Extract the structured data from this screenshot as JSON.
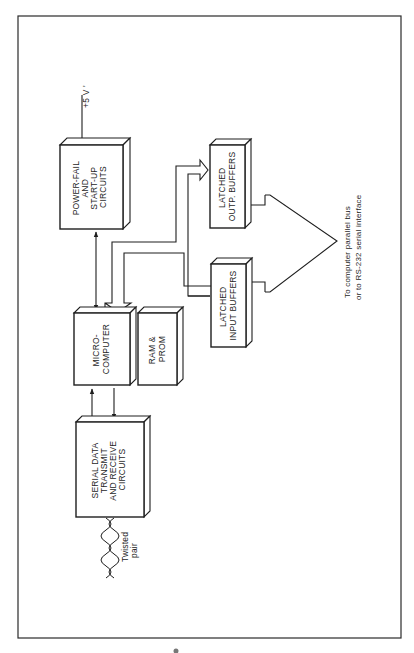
{
  "diagram": {
    "type": "block-diagram",
    "orientation": "rotated-90-ccw",
    "blocks": {
      "power_fail": {
        "lines": [
          "POWER-FAIL",
          "AND",
          "START-UP",
          "CIRCUITS"
        ]
      },
      "latched_output": {
        "lines": [
          "LATCHED",
          "OUTP. BUFFERS"
        ]
      },
      "latched_input": {
        "lines": [
          "LATCHED",
          "INPUT BUFFERS"
        ]
      },
      "microcomputer": {
        "lines": [
          "MICRO-",
          "COMPUTER"
        ]
      },
      "ram_prom": {
        "lines": [
          "RAM &",
          "PROM"
        ]
      },
      "serial": {
        "lines": [
          "SERIAL DATA",
          "TRANSMIT",
          "AND RECEIVE",
          "CIRCUITS"
        ]
      }
    },
    "labels": {
      "power_input": "+5 V '",
      "twisted_pair": [
        "Twisted",
        "pair"
      ],
      "destination": [
        "To computer parallel bus",
        "or to RS-232 serial interface"
      ]
    },
    "connections": [
      {
        "from": "+5 V",
        "to": "power_fail",
        "kind": "arrow"
      },
      {
        "from": "power_fail",
        "to": "microcomputer",
        "kind": "bidirectional"
      },
      {
        "from": "microcomputer",
        "to": "latched_output",
        "kind": "bus"
      },
      {
        "from": "latched_input",
        "to": "microcomputer",
        "kind": "bus"
      },
      {
        "from": "microcomputer",
        "to": "serial",
        "kind": "arrow"
      },
      {
        "from": "serial",
        "to": "microcomputer",
        "kind": "arrow"
      },
      {
        "from": "latched_output",
        "to": "external_bus",
        "kind": "bus"
      },
      {
        "from": "latched_input",
        "to": "external_bus",
        "kind": "bus"
      },
      {
        "from": "serial",
        "to": "twisted_pair",
        "kind": "line"
      }
    ],
    "colors": {
      "line": "#1e1e1e",
      "background": "#ffffff"
    }
  }
}
